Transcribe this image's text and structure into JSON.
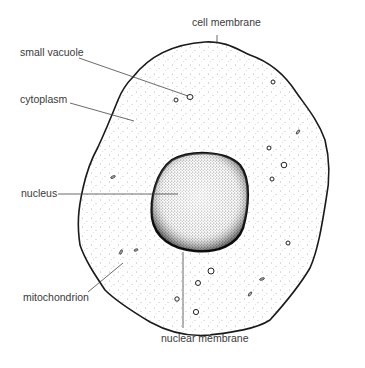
{
  "diagram": {
    "colors": {
      "background": "#ffffff",
      "outline": "#1a1a1a",
      "stipple": "#555555",
      "leader": "#444444",
      "text": "#3a3a3a"
    },
    "labels": {
      "cell_membrane": "cell membrane",
      "small_vacuole": "small vacuole",
      "cytoplasm": "cytoplasm",
      "nucleus": "nucleus",
      "mitochondrion": "mitochondrion",
      "nuclear_membrane": "nuclear membrane"
    }
  }
}
